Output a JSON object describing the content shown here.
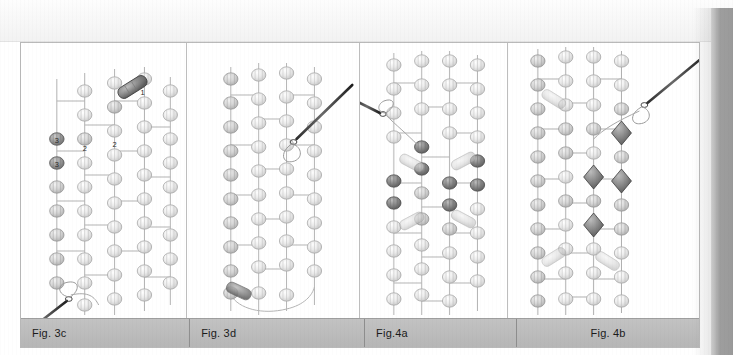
{
  "document": {
    "type": "scanned-book-page",
    "subject": "beadweaving instruction diagrams",
    "background_color": "#ffffff",
    "page_edge_color": "#9e9e9e",
    "caption_bar_color": "#bdbdbd",
    "border_color": "#b9b9b9"
  },
  "figures": [
    {
      "id": "fig-3c",
      "caption": "Fig. 3c",
      "caption_align": "left",
      "description": "Bead netting diagram with numbered beads and a threaded needle entering from lower left",
      "bead_labels": [
        "1",
        "2",
        "2",
        "3",
        "3"
      ],
      "has_needle": true,
      "needle_position": "lower-left",
      "accent_beads": 3,
      "accent_color": "#6e6e6e"
    },
    {
      "id": "fig-3d",
      "caption": "Fig. 3d",
      "caption_align": "left",
      "description": "Completed beaded band with a threaded needle entering from upper right",
      "bead_labels": [],
      "has_needle": true,
      "needle_position": "upper-right",
      "accent_beads": 2,
      "accent_color": "#8a8a8a"
    },
    {
      "id": "fig-4a",
      "caption": "Fig.4a",
      "caption_align": "left",
      "description": "Beaded band with dark accent beads forming a central motif, needle entering from the left",
      "bead_labels": [],
      "has_needle": true,
      "needle_position": "upper-left",
      "accent_beads": 9,
      "accent_color": "#5a5a5a"
    },
    {
      "id": "fig-4b",
      "caption": "Fig. 4b",
      "caption_align": "center",
      "description": "Beaded band with dark diamond shaped accent beads, needle entering from upper right",
      "bead_labels": [],
      "has_needle": true,
      "needle_position": "upper-right",
      "accent_beads": 4,
      "accent_color": "#555555"
    }
  ]
}
